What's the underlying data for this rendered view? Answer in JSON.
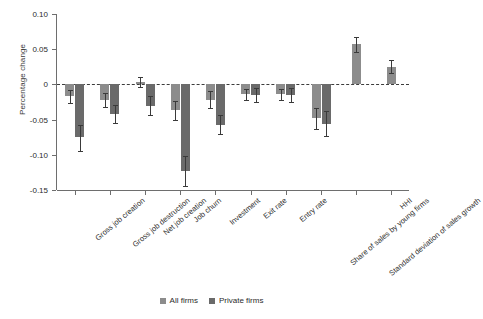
{
  "chart_data": {
    "type": "bar",
    "title": "",
    "xlabel": "",
    "ylabel": "Percentage change",
    "ylim": [
      -0.15,
      0.1
    ],
    "yticks": [
      0.1,
      0.05,
      0,
      -0.05,
      -0.1,
      -0.15
    ],
    "ytick_labels": [
      "0.10",
      "0.05",
      "0",
      "-0.05",
      "-0.10",
      "-0.15"
    ],
    "grid": false,
    "zero_reference_line": true,
    "legend_position": "bottom-center",
    "categories": [
      "Gross job creation",
      "Gross job destruction",
      "Net job creation",
      "Job churn",
      "Investment",
      "Exit rate",
      "Entry rate",
      "Share of sales by young firms",
      "Standard deviation of sales growth",
      "HHI"
    ],
    "series": [
      {
        "name": "All firms",
        "color": "#8c8c8c",
        "values": [
          -0.017,
          -0.022,
          0.003,
          -0.036,
          -0.022,
          -0.014,
          -0.014,
          -0.048,
          0.057,
          0.025
        ],
        "err_low": [
          -0.027,
          -0.032,
          -0.004,
          -0.05,
          -0.034,
          -0.022,
          -0.022,
          -0.063,
          0.046,
          0.016
        ],
        "err_high": [
          -0.008,
          -0.012,
          0.01,
          -0.023,
          -0.01,
          -0.006,
          -0.006,
          -0.034,
          0.068,
          0.034
        ]
      },
      {
        "name": "Private firms",
        "color": "#6a6a6a",
        "values": [
          -0.075,
          -0.042,
          -0.03,
          -0.123,
          -0.057,
          -0.015,
          -0.015,
          -0.056,
          null,
          null
        ],
        "err_low": [
          -0.094,
          -0.055,
          -0.043,
          -0.145,
          -0.071,
          -0.025,
          -0.025,
          -0.074,
          null,
          null
        ],
        "err_high": [
          -0.057,
          -0.029,
          -0.017,
          -0.101,
          -0.043,
          -0.005,
          -0.005,
          -0.038,
          null,
          null
        ]
      }
    ]
  },
  "legend": {
    "items": [
      {
        "label": "All firms",
        "color": "#8c8c8c"
      },
      {
        "label": "Private firms",
        "color": "#6a6a6a"
      }
    ]
  }
}
